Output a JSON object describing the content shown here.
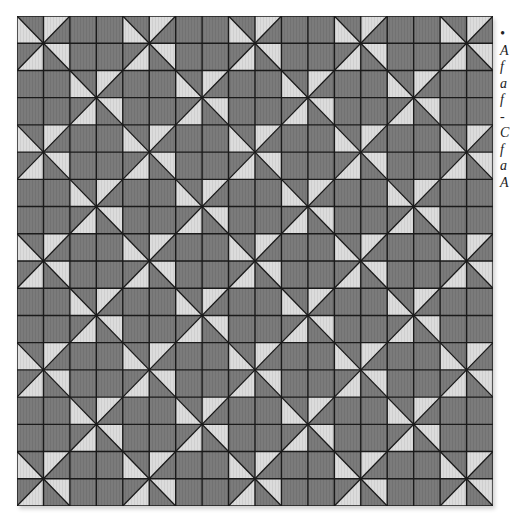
{
  "quilt": {
    "cols": 18,
    "rows": 18,
    "block_size": 4,
    "pinwheel_positions_in_block": [
      [
        0,
        0
      ],
      [
        2,
        2
      ]
    ],
    "colors": {
      "dark": "#7b7b7b",
      "light": "#dcdcdc",
      "line": "#1a1a1a"
    }
  },
  "side_text": {
    "lines": [
      "•",
      "A",
      "f",
      "a",
      "f",
      "-",
      "C",
      "f",
      "a",
      "A"
    ]
  }
}
